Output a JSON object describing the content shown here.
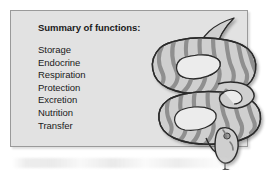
{
  "figure": {
    "name": "summary-of-functions-placenta-snake-figure",
    "panel": {
      "title": "Summary of functions:",
      "functions": [
        "Storage",
        "Endocrine",
        "Respiration",
        "Protection",
        "Excretion",
        "Nutrition",
        "Transfer"
      ]
    },
    "illustration": {
      "subject": "coiled-snake",
      "icon_name": "snake-illustration",
      "description": "Coiled snake with scalloped wavy body markings, head with forked tongue at lower right, tail at upper right"
    },
    "colors": {
      "panel_background": "#e2e2e2",
      "panel_border": "#9a9a9a",
      "text": "#1a1a1a",
      "page_background": "#ffffff",
      "snake_outline": "#2b2b2b",
      "snake_body_fill": "#cfcfcf",
      "snake_pattern": "#8f8f8f",
      "snake_highlight": "#e8e8e8"
    }
  }
}
